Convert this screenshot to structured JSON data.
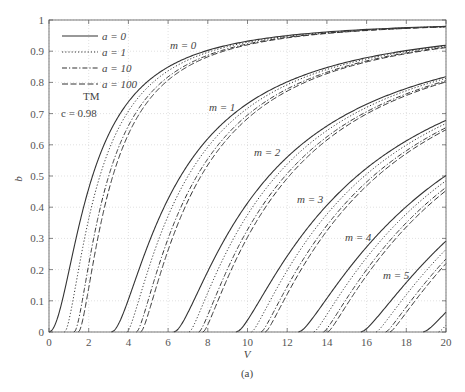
{
  "chart_data": {
    "type": "line",
    "title": "",
    "caption": "(a)",
    "xlabel": "V",
    "ylabel": "b",
    "xlim": [
      0,
      20
    ],
    "ylim": [
      0,
      1
    ],
    "x_ticks": [
      "0",
      "2",
      "4",
      "6",
      "8",
      "10",
      "12",
      "14",
      "16",
      "18",
      "20"
    ],
    "y_ticks": [
      "0",
      "0.1",
      "0.2",
      "0.3",
      "0.4",
      "0.5",
      "0.6",
      "0.7",
      "0.8",
      "0.9",
      "1"
    ],
    "grid": true,
    "legend_position": "upper-left",
    "legend": [
      {
        "label": "a = 0",
        "a": 0,
        "style": "solid",
        "dash": ""
      },
      {
        "label": "a = 1",
        "a": 1,
        "style": "dotted",
        "dash": "1.2,2"
      },
      {
        "label": "a = 10",
        "a": 10,
        "style": "dash-dot",
        "dash": "5,2,1.2,2"
      },
      {
        "label": "a = 100",
        "a": 100,
        "style": "dashed",
        "dash": "6,2.5"
      }
    ],
    "annotations": [
      {
        "text": "TM",
        "x_px": 83,
        "y_px": 100
      },
      {
        "text": "c = 0.98",
        "x_px": 61,
        "y_px": 117
      },
      {
        "text": "m = 0",
        "x_px": 170,
        "y_px": 49
      },
      {
        "text": "m = 1",
        "x_px": 209,
        "y_px": 111
      },
      {
        "text": "m = 2",
        "x_px": 254,
        "y_px": 156
      },
      {
        "text": "m = 3",
        "x_px": 297,
        "y_px": 203
      },
      {
        "text": "m = 4",
        "x_px": 345,
        "y_px": 241
      },
      {
        "text": "m = 5",
        "x_px": 383,
        "y_px": 279
      }
    ],
    "model": {
      "polarization": "TM",
      "c": 0.98,
      "equation": "V*sqrt(1-b) = m*pi + atan(c*sqrt(b/(1-b))) + atan(c*sqrt((b+a)/(1-b)))",
      "modes": [
        0,
        1,
        2,
        3,
        4,
        5,
        6
      ],
      "a_values": [
        0,
        1,
        10,
        100
      ]
    },
    "cutoffs_V": {
      "a = 0": [
        0.0,
        3.2,
        6.4,
        9.6,
        12.7,
        15.9,
        19.0
      ],
      "a = 1": [
        0.9,
        4.0,
        7.2,
        10.4,
        13.5,
        16.7,
        19.8
      ],
      "a = 10": [
        1.5,
        4.6,
        7.7,
        10.9,
        14.0,
        17.2
      ],
      "a = 100": [
        1.8,
        4.9,
        8.0,
        11.2,
        14.4,
        17.5
      ]
    },
    "series": [
      {
        "name": "m = 0, a = 0",
        "x": [
          0,
          0.67,
          1.02,
          1.37,
          1.74,
          2.19,
          2.77,
          3.59,
          4.92,
          7.86,
          11.98,
          20.0
        ],
        "values": [
          0,
          0.1,
          0.2,
          0.3,
          0.4,
          0.5,
          0.6,
          0.7,
          0.8,
          0.9,
          0.95,
          0.98
        ]
      },
      {
        "name": "b at V = 20 (a = 0) by mode",
        "x": [
          0,
          1,
          2,
          3,
          4,
          5,
          6
        ],
        "values": [
          0.98,
          0.92,
          0.82,
          0.67,
          0.5,
          0.29,
          0.06
        ]
      }
    ]
  }
}
